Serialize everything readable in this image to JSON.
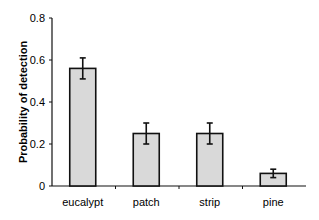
{
  "chart_data": {
    "type": "bar",
    "title": "",
    "xlabel": "",
    "ylabel": "Probability of detection",
    "categories": [
      "eucalypt",
      "patch",
      "strip",
      "pine"
    ],
    "values": [
      0.56,
      0.25,
      0.25,
      0.06
    ],
    "errors": [
      0.05,
      0.05,
      0.05,
      0.02
    ],
    "ylim": [
      0,
      0.8
    ],
    "yticks": [
      "0",
      "0.2",
      "0.4",
      "0.6",
      "0.8"
    ],
    "grid": false,
    "legend": null,
    "bar_color": "#d9d9d9"
  }
}
